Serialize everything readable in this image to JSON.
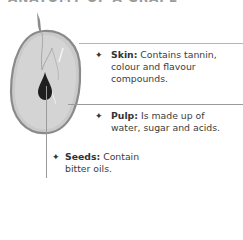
{
  "title": "ANATOMY OF A GRAPE",
  "annotations": [
    {
      "id": "skin",
      "term": "Skin:",
      "line1": " Contains tannin,",
      "line2": "colour and flavour",
      "line3": "compounds."
    },
    {
      "id": "pulp",
      "term": "Pulp:",
      "line1": " Is made up of",
      "line2": "water, sugar and acids."
    },
    {
      "id": "seeds",
      "term": "Seeds:",
      "line1": " Contain",
      "line2": "bitter oils."
    }
  ],
  "bullet_glyph": "✦",
  "colors": {
    "grape_fill": "#c9c9c9",
    "grape_edge": "#8a8a8a",
    "seed": "#1f1f1f",
    "leader_line": "#9a9a9a"
  }
}
